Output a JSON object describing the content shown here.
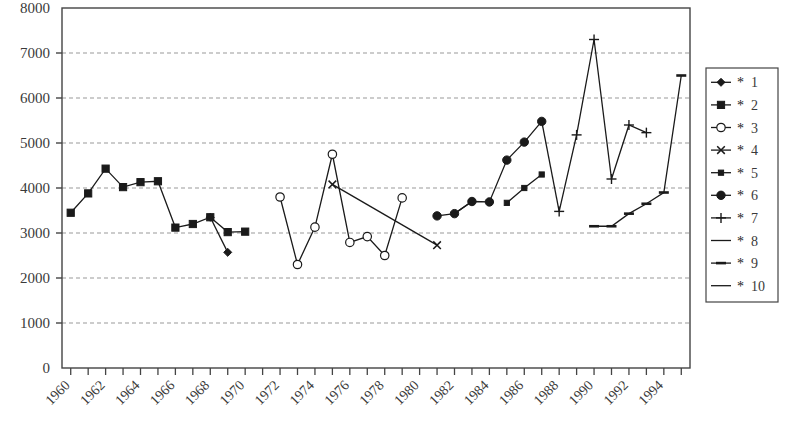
{
  "chart_data": {
    "type": "line",
    "title": "",
    "xlabel": "",
    "ylabel": "",
    "xlim": [
      1959.5,
      1995.5
    ],
    "ylim": [
      0,
      8000
    ],
    "grid": true,
    "grid_axis": "y",
    "legend_position": "right-outside",
    "y_ticks": [
      0,
      1000,
      2000,
      3000,
      4000,
      5000,
      6000,
      7000,
      8000
    ],
    "y_tick_labels": [
      "0",
      "1000",
      "2000",
      "3000",
      "4000",
      "5000",
      "6000",
      "7000",
      "8000"
    ],
    "x_ticks": [
      1960,
      1961,
      1962,
      1963,
      1964,
      1965,
      1966,
      1967,
      1968,
      1969,
      1970,
      1971,
      1972,
      1973,
      1974,
      1975,
      1976,
      1977,
      1978,
      1979,
      1980,
      1981,
      1982,
      1983,
      1984,
      1985,
      1986,
      1987,
      1988,
      1989,
      1990,
      1991,
      1992,
      1993,
      1994,
      1995
    ],
    "x_tick_labels": [
      "1960",
      "1962",
      "1964",
      "1966",
      "1968",
      "1970",
      "1972",
      "1974",
      "1976",
      "1978",
      "1980",
      "1982",
      "1984",
      "1986",
      "1988",
      "1990",
      "1992",
      "1994"
    ],
    "x_tick_label_values": [
      1960,
      1962,
      1964,
      1966,
      1968,
      1970,
      1972,
      1974,
      1976,
      1978,
      1980,
      1982,
      1984,
      1986,
      1988,
      1990,
      1992,
      1994
    ],
    "x_tick_label_rotation": -45,
    "series": [
      {
        "name": "* 1",
        "legend_label": "1",
        "marker": "diamond",
        "color": "#1a1a1a",
        "x": [
          1968,
          1969
        ],
        "y": [
          3350,
          2570
        ]
      },
      {
        "name": "* 2",
        "legend_label": "2",
        "marker": "square",
        "color": "#1a1a1a",
        "x": [
          1960,
          1961,
          1962,
          1963,
          1964,
          1965,
          1966,
          1967,
          1968,
          1969,
          1970
        ],
        "y": [
          3450,
          3880,
          4430,
          4020,
          4130,
          4150,
          3120,
          3200,
          3350,
          3020,
          3030
        ]
      },
      {
        "name": "* 3",
        "legend_label": "3",
        "marker": "circle-open",
        "color": "#1a1a1a",
        "x": [
          1972,
          1973,
          1974,
          1975,
          1976,
          1977,
          1978,
          1979
        ],
        "y": [
          3800,
          2300,
          3130,
          4750,
          2790,
          2920,
          2500,
          3780
        ]
      },
      {
        "name": "* 4",
        "legend_label": "4",
        "marker": "x",
        "color": "#1a1a1a",
        "x": [
          1975,
          1981
        ],
        "y": [
          4080,
          2730
        ]
      },
      {
        "name": "* 5",
        "legend_label": "5",
        "marker": "small-square",
        "color": "#1a1a1a",
        "x": [
          1985,
          1986,
          1987
        ],
        "y": [
          3670,
          4000,
          4300
        ]
      },
      {
        "name": "* 6",
        "legend_label": "6",
        "marker": "circle-filled",
        "color": "#1a1a1a",
        "x": [
          1981,
          1982,
          1983,
          1984,
          1985,
          1986,
          1987
        ],
        "y": [
          3380,
          3430,
          3700,
          3690,
          4620,
          5020,
          5480
        ]
      },
      {
        "name": "* 7",
        "legend_label": "7",
        "marker": "plus",
        "color": "#1a1a1a",
        "x": [
          1988,
          1989,
          1990,
          1991,
          1992,
          1993
        ],
        "y": [
          3480,
          5180,
          7300,
          4200,
          5400,
          5230
        ]
      },
      {
        "name": "* 8",
        "legend_label": "8",
        "marker": "none",
        "color": "#1a1a1a",
        "x": [
          1987,
          1988
        ],
        "y": [
          5480,
          3480
        ]
      },
      {
        "name": "* 9",
        "legend_label": "9",
        "marker": "dash",
        "color": "#1a1a1a",
        "x": [
          1990,
          1991,
          1992,
          1993,
          1994,
          1995
        ],
        "y": [
          3150,
          3150,
          3430,
          3650,
          3900,
          6500
        ]
      },
      {
        "name": "* 10",
        "legend_label": "10",
        "marker": "none",
        "color": "#1a1a1a",
        "x": [
          1982,
          1983
        ],
        "y": [
          3430,
          3700
        ]
      }
    ],
    "legend_entries": [
      {
        "star": "*",
        "label": "1",
        "marker": "diamond"
      },
      {
        "star": "*",
        "label": "2",
        "marker": "square"
      },
      {
        "star": "*",
        "label": "3",
        "marker": "circle-open"
      },
      {
        "star": "*",
        "label": "4",
        "marker": "x"
      },
      {
        "star": "*",
        "label": "5",
        "marker": "small-square"
      },
      {
        "star": "*",
        "label": "6",
        "marker": "circle-filled"
      },
      {
        "star": "*",
        "label": "7",
        "marker": "plus"
      },
      {
        "star": "*",
        "label": "8",
        "marker": "none"
      },
      {
        "star": "*",
        "label": "9",
        "marker": "dash"
      },
      {
        "star": "*",
        "label": "10",
        "marker": "none"
      }
    ],
    "colors": {
      "axis": "#444444",
      "grid": "#999999",
      "series": "#1a1a1a",
      "background": "#ffffff",
      "text": "#3a3a3a"
    }
  }
}
